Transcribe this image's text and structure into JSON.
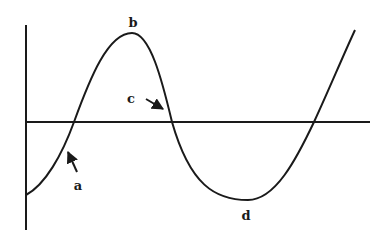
{
  "diagram": {
    "colors": {
      "line": "#1a1a1a",
      "background": "#ffffff"
    },
    "axes": {
      "vertical": {
        "x": 26,
        "y1": 25,
        "y2": 230
      },
      "horizontal": {
        "y": 122,
        "x1": 26,
        "x2": 370
      }
    },
    "curve_path": "M26,195 C45,185 62,155 74,122 C90,78 108,33 132,33 C150,33 162,80 172,122 C190,185 215,200 248,200 C275,200 296,160 314,122 C328,92 342,58 355,30",
    "labels": [
      {
        "id": "a",
        "text": "a",
        "x": 78,
        "y": 185
      },
      {
        "id": "b",
        "text": "b",
        "x": 133,
        "y": 22
      },
      {
        "id": "c",
        "text": "c",
        "x": 131,
        "y": 98
      },
      {
        "id": "d",
        "text": "d",
        "x": 246,
        "y": 215
      }
    ],
    "arrows": [
      {
        "for": "a",
        "x1": 77,
        "y1": 172,
        "x2": 68,
        "y2": 152
      },
      {
        "for": "c",
        "x1": 146,
        "y1": 99,
        "x2": 163,
        "y2": 109
      }
    ]
  }
}
